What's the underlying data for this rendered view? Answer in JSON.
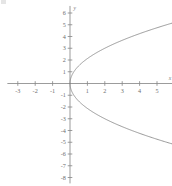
{
  "figure": {
    "kind": "cartesian-plot",
    "background_color": "#ffffff",
    "axis_color": "#8a8a8a",
    "curve_color": "#808080",
    "label_color": "#6e6e6e",
    "x_axis_name": "x",
    "y_axis_name": "y"
  },
  "chart_data": {
    "type": "line",
    "title": "",
    "xlabel": "x",
    "ylabel": "y",
    "grid": false,
    "legend": null,
    "xlim": [
      -3.6,
      5.9
    ],
    "ylim": [
      -8.5,
      6.6
    ],
    "xticks": [
      -3,
      -2,
      -1,
      1,
      2,
      3,
      4,
      5
    ],
    "yticks": [
      6,
      5,
      4,
      3,
      2,
      1,
      -1,
      -2,
      -3,
      -4,
      -5,
      -6,
      -7,
      -8
    ],
    "xtick_labels": [
      "-3",
      "-2",
      "-1",
      "1",
      "2",
      "3",
      "4",
      "5"
    ],
    "ytick_labels": [
      "6",
      "5",
      "4",
      "3",
      "2",
      "1",
      "-1",
      "-2",
      "-3",
      "-4",
      "-5",
      "-6",
      "-7",
      "-8"
    ],
    "equation": "x = y^2 / 4.5",
    "series": [
      {
        "name": "upper branch",
        "x": [
          0,
          0.02,
          0.09,
          0.2,
          0.36,
          0.56,
          0.8,
          1.0,
          1.26,
          1.56,
          1.89,
          2.0,
          2.25,
          2.64,
          3.06,
          3.5,
          4.0,
          4.5,
          5.0,
          5.44,
          5.8
        ],
        "y": [
          0,
          0.3,
          0.64,
          0.95,
          1.27,
          1.59,
          1.9,
          2.12,
          2.38,
          2.65,
          2.92,
          3.0,
          3.18,
          3.45,
          3.71,
          3.97,
          4.24,
          4.5,
          4.74,
          4.95,
          5.11
        ]
      },
      {
        "name": "lower branch",
        "x": [
          0,
          0.02,
          0.09,
          0.2,
          0.36,
          0.56,
          0.8,
          1.0,
          1.26,
          1.56,
          1.89,
          2.0,
          2.25,
          2.64,
          3.06,
          3.5,
          4.0,
          4.5,
          5.0,
          5.44,
          5.8
        ],
        "y": [
          0,
          -0.3,
          -0.64,
          -0.95,
          -1.27,
          -1.59,
          -1.9,
          -2.12,
          -2.38,
          -2.65,
          -2.92,
          -3.0,
          -3.18,
          -3.45,
          -3.71,
          -3.97,
          -4.24,
          -4.5,
          -4.74,
          -4.95,
          -5.11
        ]
      }
    ]
  }
}
